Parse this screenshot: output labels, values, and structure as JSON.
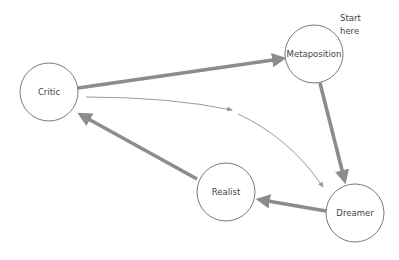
{
  "diagram": {
    "type": "cycle",
    "colors": {
      "node_stroke": "#6b6b6b",
      "edge": "#8c8c8c",
      "edge_thin": "#9a9a9a",
      "text": "#444444",
      "background": "#ffffff"
    },
    "nodes": [
      {
        "id": "critic",
        "label": "Critic",
        "cx": 49,
        "cy": 92,
        "r": 29
      },
      {
        "id": "metaposition",
        "label": "Metaposition",
        "cx": 314,
        "cy": 54,
        "r": 29
      },
      {
        "id": "dreamer",
        "label": "Dreamer",
        "cx": 355,
        "cy": 213,
        "r": 29
      },
      {
        "id": "realist",
        "label": "Realist",
        "cx": 226,
        "cy": 192,
        "r": 29
      }
    ],
    "edges": [
      {
        "from": "critic",
        "to": "metaposition",
        "style": "thick"
      },
      {
        "from": "metaposition",
        "to": "dreamer",
        "style": "thick"
      },
      {
        "from": "dreamer",
        "to": "realist",
        "style": "thick"
      },
      {
        "from": "realist",
        "to": "critic",
        "style": "thick"
      },
      {
        "from": "critic",
        "to": "dreamer",
        "style": "thin-curved"
      }
    ],
    "annotation": {
      "line1": "Start",
      "line2": "here"
    }
  }
}
